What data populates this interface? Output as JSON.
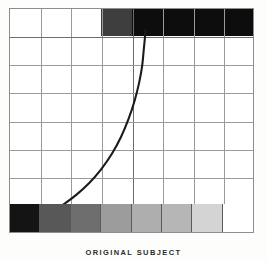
{
  "figure": {
    "caption": "ORIGINAL SUBJECT",
    "frame_color": "#8d8d8d",
    "grid_color": "#9a9a9a",
    "curve_color": "#1a1a1a",
    "background": "#ffffff"
  },
  "chart_data": {
    "type": "line",
    "title": "ORIGINAL SUBJECT",
    "xlabel": "",
    "ylabel": "",
    "xlim": [
      0,
      8
    ],
    "ylim": [
      0,
      8
    ],
    "grid": true,
    "grid_columns": 8,
    "grid_rows": 8,
    "legend": "none",
    "annotations": [
      "Top band: white for columns 1-3, mid-dark gray at column 4, solid black for columns 5-8",
      "Bottom band: 8-step gray scale wedge from black at column 1 to white at column 8",
      "Curve: characteristic tone-reproduction curve rising steeply from lower-left toward upper-middle"
    ],
    "series": [
      {
        "name": "characteristic-curve",
        "x": [
          1.15,
          1.45,
          1.8,
          2.2,
          2.6,
          3.0,
          3.35,
          3.65,
          3.9,
          4.1,
          4.25,
          4.35,
          4.4,
          4.44,
          4.46
        ],
        "y": [
          0.6,
          0.78,
          1.02,
          1.35,
          1.75,
          2.25,
          2.8,
          3.4,
          4.05,
          4.7,
          5.35,
          5.95,
          6.5,
          6.95,
          7.25
        ]
      }
    ],
    "top_band_values": [
      {
        "column": 1,
        "tone": "white",
        "color": "#ffffff"
      },
      {
        "column": 2,
        "tone": "white",
        "color": "#ffffff"
      },
      {
        "column": 3,
        "tone": "white",
        "color": "#ffffff"
      },
      {
        "column": 4,
        "tone": "dark-gray",
        "color": "#3e3e3e"
      },
      {
        "column": 5,
        "tone": "black",
        "color": "#0d0d0d"
      },
      {
        "column": 6,
        "tone": "black",
        "color": "#0d0d0d"
      },
      {
        "column": 7,
        "tone": "black",
        "color": "#0d0d0d"
      },
      {
        "column": 8,
        "tone": "black",
        "color": "#0d0d0d"
      }
    ],
    "bottom_band_values": [
      {
        "step": 1,
        "tone": "black",
        "color": "#141414"
      },
      {
        "step": 2,
        "tone": "dark-gray",
        "color": "#585858"
      },
      {
        "step": 3,
        "tone": "mid-dark-gray",
        "color": "#6e6e6e"
      },
      {
        "step": 4,
        "tone": "mid-gray",
        "color": "#9c9c9c"
      },
      {
        "step": 5,
        "tone": "light-gray",
        "color": "#aeaeae"
      },
      {
        "step": 6,
        "tone": "lighter-gray",
        "color": "#b6b6b6"
      },
      {
        "step": 7,
        "tone": "very-light",
        "color": "#d4d4d4"
      },
      {
        "step": 8,
        "tone": "white",
        "color": "#ffffff"
      }
    ]
  }
}
